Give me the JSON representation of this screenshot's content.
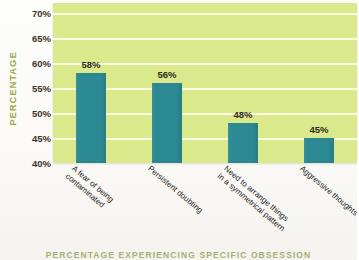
{
  "chart_data": {
    "type": "bar",
    "title": "",
    "xlabel": "PERCENTAGE EXPERIENCING SPECIFIC OBSESSION",
    "ylabel": "PERCENTAGE",
    "categories": [
      "A fear of being contaminated",
      "Persistent doubting",
      "Need to arrange things in a symmetrical pattern",
      "Aggressive thoughts"
    ],
    "category_lines": [
      [
        "A fear of being",
        "contaminated"
      ],
      [
        "Persistent doubting",
        ""
      ],
      [
        "Need to arrange things",
        "in a symmetrical pattern"
      ],
      [
        "Aggressive thoughts",
        ""
      ]
    ],
    "values": [
      58,
      56,
      48,
      45
    ],
    "value_labels": [
      "58%",
      "56%",
      "48%",
      "45%"
    ],
    "ylim": [
      40,
      72
    ],
    "yticks": [
      40,
      45,
      50,
      55,
      60,
      65,
      70
    ],
    "ytick_labels": [
      "40%",
      "45%",
      "50%",
      "55%",
      "60%",
      "65%",
      "70%"
    ],
    "grid": true,
    "legend": "none",
    "colors": {
      "bar": "#2b8a93",
      "plot_background": "#dbe98d",
      "gridline": "#fbfde4",
      "axis_title": "#9aab4a",
      "tick_label": "#3c3326",
      "caption": "#7f9a3f"
    }
  }
}
